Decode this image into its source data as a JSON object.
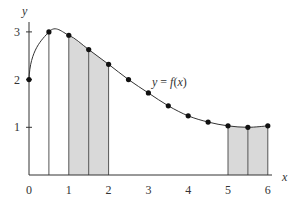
{
  "chart_data": {
    "type": "line",
    "title": "",
    "xlabel": "x",
    "ylabel": "y",
    "curve_label": "y = f(x)",
    "xlim": [
      0,
      6
    ],
    "ylim": [
      0,
      3
    ],
    "x_ticks": [
      "0",
      "1",
      "2",
      "3",
      "4",
      "5",
      "6"
    ],
    "y_ticks": [
      "1",
      "2",
      "3"
    ],
    "grid": false,
    "legend": "none",
    "series": [
      {
        "name": "f(x)",
        "x": [
          0,
          0.5,
          1,
          1.5,
          2,
          2.5,
          3,
          3.5,
          4,
          4.5,
          5,
          5.5,
          6
        ],
        "values": [
          2.0,
          3.0,
          2.93,
          2.63,
          2.32,
          2.0,
          1.72,
          1.45,
          1.24,
          1.11,
          1.03,
          1.0,
          1.03
        ]
      }
    ],
    "shaded_regions": [
      {
        "x_start": 1,
        "x_end": 2,
        "dividers": [
          1.5
        ]
      },
      {
        "x_start": 5,
        "x_end": 6,
        "dividers": [
          5.5
        ]
      }
    ],
    "vertical_lines": [
      0.5
    ],
    "colors": {
      "shade": "#d9d9d9",
      "line": "#333333",
      "point": "#111111"
    }
  }
}
